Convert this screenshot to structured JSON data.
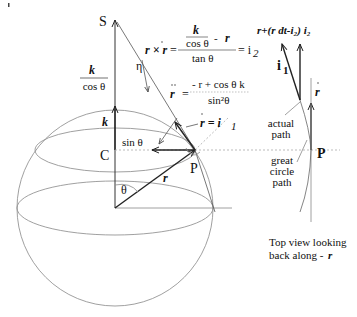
{
  "labels": {
    "S": "S",
    "C": "C",
    "P": "P",
    "P_top": "P",
    "theta": "θ",
    "eta": "η",
    "k": "k",
    "k_over_cos_num": "k",
    "k_over_cos_den": "cos θ",
    "sin_theta": "sin θ",
    "r": "r",
    "r_dot_eq": "r = i",
    "r_dot_eq_sub": "1",
    "i1": "i",
    "i1_sub": "1",
    "r_dot_top": "r",
    "actual_path": [
      "actual",
      "path"
    ],
    "great_circle_path": [
      "great",
      "circle",
      "path"
    ],
    "top_view": [
      "Top view looking",
      "back along -"
    ],
    "top_view_r": "r"
  },
  "equations": {
    "cross": {
      "lhs": "r × r",
      "eq": "=",
      "num_top": "k",
      "num_bottom": "cos θ",
      "num_minus": "-",
      "num_r": "r",
      "den": "tan θ",
      "rhs": "= i",
      "rhs_sub": "2"
    },
    "rddot": {
      "lhs": "r",
      "eq": "=",
      "num": "- r + cos θ k",
      "den": "sin²θ"
    },
    "top_expr": "r+(r dt-i₂) i₂"
  },
  "colors": {
    "line": "#222222",
    "thin": "#888888",
    "dash": "#aaaaaa"
  }
}
